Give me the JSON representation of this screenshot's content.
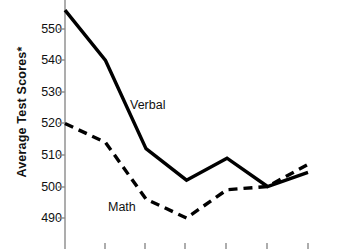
{
  "chart_data": {
    "type": "line",
    "title": "",
    "xlabel": "",
    "ylabel": "Average Test Scores*",
    "ylim": [
      486,
      558
    ],
    "xlim": [
      0,
      7
    ],
    "grid": false,
    "legend_position": "inline-annotation",
    "ytick_labels": [
      "550",
      "540",
      "530",
      "520",
      "510",
      "500",
      "490"
    ],
    "ytick_values": [
      550,
      540,
      530,
      520,
      510,
      500,
      490
    ],
    "xtick_labels": [
      "",
      "",
      "",
      "",
      "",
      "",
      ""
    ],
    "x": [
      0,
      1,
      2,
      3,
      4,
      5,
      6
    ],
    "series": [
      {
        "name": "Verbal",
        "style": "solid",
        "color": "#000000",
        "values": [
          556,
          540,
          512,
          502,
          509,
          500,
          504.5
        ]
      },
      {
        "name": "Math",
        "style": "dashed",
        "color": "#000000",
        "values": [
          520,
          514,
          496,
          490,
          499,
          500,
          507
        ]
      }
    ],
    "annotations": [
      {
        "text": "Verbal",
        "x": 130,
        "y": 98
      },
      {
        "text": "Math",
        "x": 108,
        "y": 200
      }
    ]
  },
  "axis": {
    "line_color": "#808080",
    "tick_color": "#808080"
  }
}
